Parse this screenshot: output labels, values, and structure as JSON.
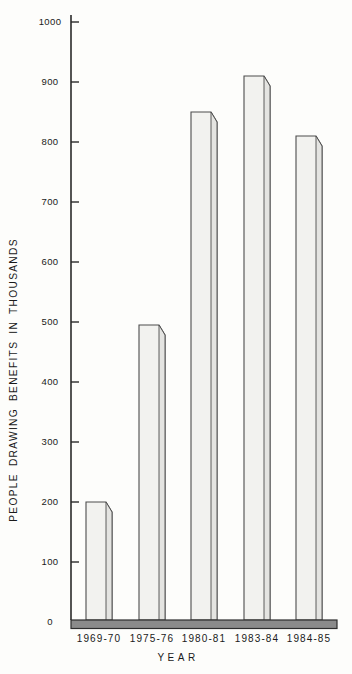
{
  "page": {
    "background_color": "#fdfdfb",
    "text_color": "#1a1a1a"
  },
  "chart_data": {
    "type": "bar",
    "title": "",
    "categories": [
      "1969-70",
      "1975-76",
      "1980-81",
      "1983-84",
      "1984-85"
    ],
    "values": [
      200,
      495,
      850,
      910,
      810
    ],
    "xlabel": "YEAR",
    "ylabel": "PEOPLE DRAWING BENEFITS IN THOUSANDS",
    "ylim": [
      0,
      1000
    ],
    "yticks": [
      0,
      100,
      200,
      300,
      400,
      500,
      600,
      700,
      800,
      900,
      1000
    ],
    "grid": false,
    "legend": "none",
    "bar_style": "3d-column",
    "colors": {
      "bar_face": "#f2f2ef",
      "bar_side": "#e4e4e1",
      "bar_outline": "#4d4d4d",
      "axis_line": "#2a2a2a",
      "baseline_band_fill": "#8b8b8b",
      "baseline_band_outline": "#2e2e2e",
      "label_text": "#1a1a1a"
    }
  }
}
